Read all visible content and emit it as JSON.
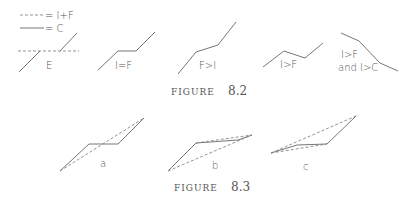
{
  "legend": {
    "dashed_label": "= I+F",
    "solid_label": "= C"
  },
  "figure_8_2": {
    "caption_word": "FIGURE",
    "caption_num": "8.2",
    "panels": [
      {
        "label": "E"
      },
      {
        "label": "I=F"
      },
      {
        "label": "F>I"
      },
      {
        "label": "I>F"
      },
      {
        "label_line1": "I>F",
        "label_line2": "and I>C"
      }
    ]
  },
  "figure_8_3": {
    "caption_word": "FIGURE",
    "caption_num": "8.3",
    "panels": [
      {
        "label": "a"
      },
      {
        "label": "b"
      },
      {
        "label": "c"
      }
    ]
  },
  "colors": {
    "line": "#666666",
    "dashed": "#888888",
    "text": "#555555"
  }
}
